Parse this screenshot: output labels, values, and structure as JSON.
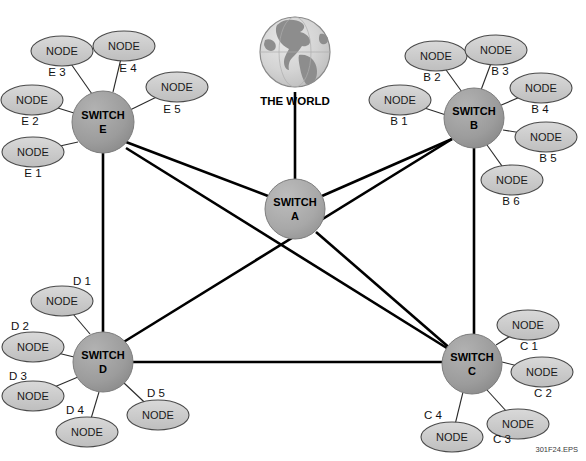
{
  "diagram": {
    "figure_id": "301F24.EPS",
    "world": {
      "caption": "THE WORLD",
      "icon": "globe-icon",
      "cx": 295,
      "cy": 52,
      "r": 35
    },
    "colors": {
      "switch_core_fill": "#a5a5a5",
      "switch_edge_fill": "#9a9a9a",
      "node_fill": "#c9c9c9",
      "node_stroke": "#4a4a4a",
      "trunk_stroke": "#000000",
      "access_stroke": "#2b2b2b",
      "globe_ocean": "#d2d2d2",
      "globe_land": "#8d8d8d",
      "background": "#ffffff",
      "text": "#000000"
    },
    "switches": [
      {
        "id": "A",
        "line1": "SWITCH",
        "line2": "A",
        "cx": 295,
        "cy": 209,
        "r": 30,
        "tier": "core"
      },
      {
        "id": "B",
        "line1": "SWITCH",
        "line2": "B",
        "cx": 474,
        "cy": 118,
        "r": 30,
        "tier": "edge"
      },
      {
        "id": "C",
        "line1": "SWITCH",
        "line2": "C",
        "cx": 472,
        "cy": 364,
        "r": 30,
        "tier": "edge"
      },
      {
        "id": "D",
        "line1": "SWITCH",
        "line2": "D",
        "cx": 103,
        "cy": 362,
        "r": 30,
        "tier": "edge"
      },
      {
        "id": "E",
        "line1": "SWITCH",
        "line2": "E",
        "cx": 103,
        "cy": 122,
        "r": 31,
        "tier": "edge"
      }
    ],
    "trunks": [
      {
        "from": "WORLD",
        "to": "A",
        "x1": 295,
        "y1": 92,
        "x2": 295,
        "y2": 179
      },
      {
        "from": "E",
        "to": "A",
        "x1": 126,
        "y1": 142,
        "x2": 268,
        "y2": 196
      },
      {
        "from": "A",
        "to": "B",
        "x1": 322,
        "y1": 196,
        "x2": 452,
        "y2": 139
      },
      {
        "from": "E",
        "to": "C",
        "x1": 126,
        "y1": 148,
        "x2": 450,
        "y2": 350
      },
      {
        "from": "A",
        "to": "C",
        "x1": 316,
        "y1": 232,
        "x2": 452,
        "y2": 350
      },
      {
        "from": "D",
        "to": "B",
        "x1": 122,
        "y1": 343,
        "x2": 452,
        "y2": 139
      },
      {
        "from": "E",
        "to": "D",
        "x1": 103,
        "y1": 153,
        "x2": 103,
        "y2": 332
      },
      {
        "from": "D",
        "to": "C",
        "x1": 133,
        "y1": 362,
        "x2": 442,
        "y2": 362
      },
      {
        "from": "B",
        "to": "C",
        "x1": 474,
        "y1": 148,
        "x2": 474,
        "y2": 334
      }
    ],
    "nodes": [
      {
        "tag": "E 1",
        "label": "NODE",
        "switch": "E",
        "cx": 33,
        "cy": 152,
        "tag_x": 33,
        "tag_y": 174,
        "link_x": 78,
        "link_y": 142
      },
      {
        "tag": "E 2",
        "label": "NODE",
        "switch": "E",
        "cx": 32,
        "cy": 100,
        "tag_x": 30,
        "tag_y": 122,
        "link_x": 74,
        "link_y": 113
      },
      {
        "tag": "E 3",
        "label": "NODE",
        "switch": "E",
        "cx": 62,
        "cy": 51,
        "tag_x": 57,
        "tag_y": 73,
        "link_x": 92,
        "link_y": 94
      },
      {
        "tag": "E 4",
        "label": "NODE",
        "switch": "E",
        "cx": 124,
        "cy": 46,
        "tag_x": 128,
        "tag_y": 69,
        "link_x": 113,
        "link_y": 92
      },
      {
        "tag": "E 5",
        "label": "NODE",
        "switch": "E",
        "cx": 177,
        "cy": 87,
        "tag_x": 172,
        "tag_y": 110,
        "link_x": 130,
        "link_y": 110
      },
      {
        "tag": "B 1",
        "label": "NODE",
        "switch": "B",
        "cx": 400,
        "cy": 100,
        "tag_x": 399,
        "tag_y": 122,
        "link_x": 446,
        "link_y": 115
      },
      {
        "tag": "B 2",
        "label": "NODE",
        "switch": "B",
        "cx": 436,
        "cy": 56,
        "tag_x": 432,
        "tag_y": 78,
        "link_x": 462,
        "link_y": 92
      },
      {
        "tag": "B 3",
        "label": "NODE",
        "switch": "B",
        "cx": 496,
        "cy": 50,
        "tag_x": 500,
        "tag_y": 72,
        "link_x": 481,
        "link_y": 90
      },
      {
        "tag": "B 4",
        "label": "NODE",
        "switch": "B",
        "cx": 541,
        "cy": 88,
        "tag_x": 540,
        "tag_y": 110,
        "link_x": 499,
        "link_y": 106
      },
      {
        "tag": "B 5",
        "label": "NODE",
        "switch": "B",
        "cx": 546,
        "cy": 137,
        "tag_x": 548,
        "tag_y": 159,
        "link_x": 503,
        "link_y": 130
      },
      {
        "tag": "B 6",
        "label": "NODE",
        "switch": "B",
        "cx": 512,
        "cy": 180,
        "tag_x": 511,
        "tag_y": 202,
        "link_x": 487,
        "link_y": 145
      },
      {
        "tag": "C 1",
        "label": "NODE",
        "switch": "C",
        "cx": 528,
        "cy": 325,
        "tag_x": 529,
        "tag_y": 347,
        "link_x": 496,
        "link_y": 345
      },
      {
        "tag": "C 2",
        "label": "NODE",
        "switch": "C",
        "cx": 542,
        "cy": 372,
        "tag_x": 543,
        "tag_y": 394,
        "link_x": 502,
        "link_y": 362
      },
      {
        "tag": "C 3",
        "label": "NODE",
        "switch": "C",
        "cx": 518,
        "cy": 424,
        "tag_x": 502,
        "tag_y": 440,
        "link_x": 487,
        "link_y": 390
      },
      {
        "tag": "C 4",
        "label": "NODE",
        "switch": "C",
        "cx": 452,
        "cy": 437,
        "tag_x": 433,
        "tag_y": 416,
        "link_x": 463,
        "link_y": 392
      },
      {
        "tag": "D 1",
        "label": "NODE",
        "switch": "D",
        "cx": 62,
        "cy": 301,
        "tag_x": 82,
        "tag_y": 282,
        "link_x": 90,
        "link_y": 334
      },
      {
        "tag": "D 2",
        "label": "NODE",
        "switch": "D",
        "cx": 33,
        "cy": 347,
        "tag_x": 20,
        "tag_y": 327,
        "link_x": 74,
        "link_y": 357
      },
      {
        "tag": "D 3",
        "label": "NODE",
        "switch": "D",
        "cx": 33,
        "cy": 396,
        "tag_x": 18,
        "tag_y": 377,
        "link_x": 78,
        "link_y": 377
      },
      {
        "tag": "D 4",
        "label": "NODE",
        "switch": "D",
        "cx": 87,
        "cy": 432,
        "tag_x": 75,
        "tag_y": 411,
        "link_x": 99,
        "link_y": 392
      },
      {
        "tag": "D 5",
        "label": "NODE",
        "switch": "D",
        "cx": 158,
        "cy": 415,
        "tag_x": 156,
        "tag_y": 394,
        "link_x": 124,
        "link_y": 383
      }
    ],
    "node_size": {
      "rx": 31,
      "ry": 15
    }
  }
}
